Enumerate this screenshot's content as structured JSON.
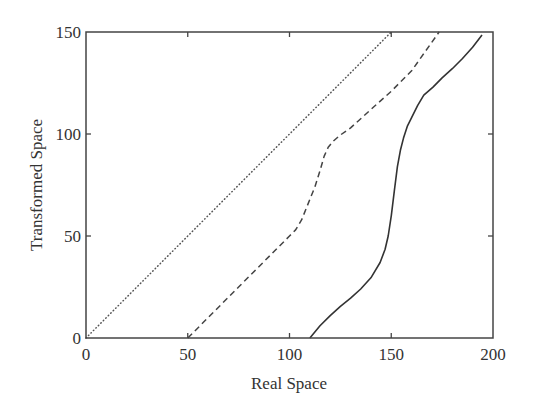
{
  "chart_data": {
    "type": "line",
    "title": "",
    "xlabel": "Real Space",
    "ylabel": "Transformed Space",
    "xlim": [
      0,
      200
    ],
    "ylim": [
      0,
      150
    ],
    "xticks": [
      0,
      50,
      100,
      150,
      200
    ],
    "yticks": [
      0,
      50,
      100,
      150
    ],
    "xtick_labels": [
      "0",
      "50",
      "100",
      "150",
      "200"
    ],
    "ytick_labels": [
      "0",
      "50",
      "100",
      "150"
    ],
    "grid": false,
    "legend": null,
    "series": [
      {
        "name": "dotted",
        "style": "dotted",
        "color": "#555555",
        "x": [
          0,
          150
        ],
        "y": [
          0,
          150
        ]
      },
      {
        "name": "dashed",
        "style": "dashed",
        "color": "#444444",
        "x": [
          50,
          75,
          100,
          103,
          106,
          108,
          110,
          112.5,
          115,
          117,
          119,
          121.5,
          125,
          130,
          140,
          150,
          160,
          173.5
        ],
        "y": [
          0,
          25,
          50,
          53,
          58,
          63,
          68,
          74,
          82,
          89,
          93.5,
          96.5,
          99.5,
          103,
          112,
          121,
          131,
          150
        ]
      },
      {
        "name": "solid",
        "style": "solid",
        "color": "#333333",
        "x": [
          110,
          115,
          120,
          125,
          130,
          135,
          140,
          144.5,
          147,
          148.5,
          150,
          151.5,
          153,
          154.5,
          156,
          158,
          160,
          163,
          166,
          170.5,
          175,
          180,
          185,
          190,
          194.6
        ],
        "y": [
          0,
          6,
          11,
          15.5,
          19.5,
          24,
          29.5,
          37,
          43.5,
          50,
          60,
          72,
          84,
          92,
          98,
          104,
          108,
          114,
          119,
          123,
          127.5,
          132,
          137,
          142.5,
          148.5
        ]
      }
    ]
  }
}
